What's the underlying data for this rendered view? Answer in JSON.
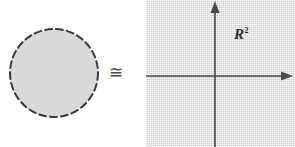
{
  "figure": {
    "width": 295,
    "height": 147,
    "background_color": "#ffffff"
  },
  "left_shape": {
    "name": "disk",
    "kind": "filled-circle",
    "border_style": "dashed",
    "fill_color": "#d9d9d9",
    "stroke_color": "#3a3a3a",
    "center_x": 54,
    "center_y": 73,
    "radius": 46
  },
  "relation": {
    "symbol": "≅",
    "meaning": "congruent-to"
  },
  "right_shape": {
    "name": "coordinate-plane",
    "background_color": "#dcdcdc",
    "label": "R",
    "label_exponent": "2",
    "axis_color": "#4a4a4a",
    "origin_x": 69,
    "origin_y": 76,
    "x_axis_arrow": "right",
    "y_axis_arrow": "up"
  }
}
